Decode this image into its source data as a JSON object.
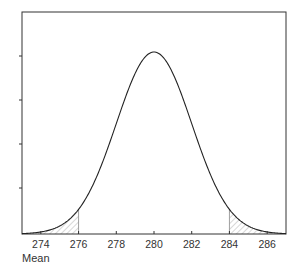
{
  "chart_data": {
    "type": "line",
    "title": "",
    "xlabel": "Mean",
    "ylabel": "",
    "xlim": [
      273,
      287
    ],
    "ylim": [
      0,
      1.0
    ],
    "x_ticks": [
      274,
      276,
      278,
      280,
      282,
      284,
      286
    ],
    "x_tick_labels": [
      "274",
      "276",
      "278",
      "280",
      "282",
      "284",
      "286"
    ],
    "y_ticks_count": 4,
    "y_tick_labels": [],
    "grid": false,
    "legend": null,
    "series": [
      {
        "name": "Normal sampling distribution of the mean",
        "distribution": "normal",
        "mean": 280,
        "sd": 2,
        "x": [
          273,
          274,
          275,
          276,
          277,
          278,
          279,
          280,
          281,
          282,
          283,
          284,
          285,
          286,
          287
        ],
        "y_relative": [
          0.002,
          0.011,
          0.044,
          0.135,
          0.325,
          0.607,
          0.882,
          1.0,
          0.882,
          0.607,
          0.325,
          0.135,
          0.044,
          0.011,
          0.002
        ]
      }
    ],
    "shaded_regions": [
      {
        "name": "lower-tail",
        "from": 273,
        "to": 276,
        "pattern": "diagonal-hatch"
      },
      {
        "name": "upper-tail",
        "from": 284,
        "to": 287,
        "pattern": "diagonal-hatch"
      }
    ]
  },
  "colors": {
    "axis": "#333333",
    "curve": "#222222",
    "hatch": "#999999",
    "boundary": "#888888"
  }
}
